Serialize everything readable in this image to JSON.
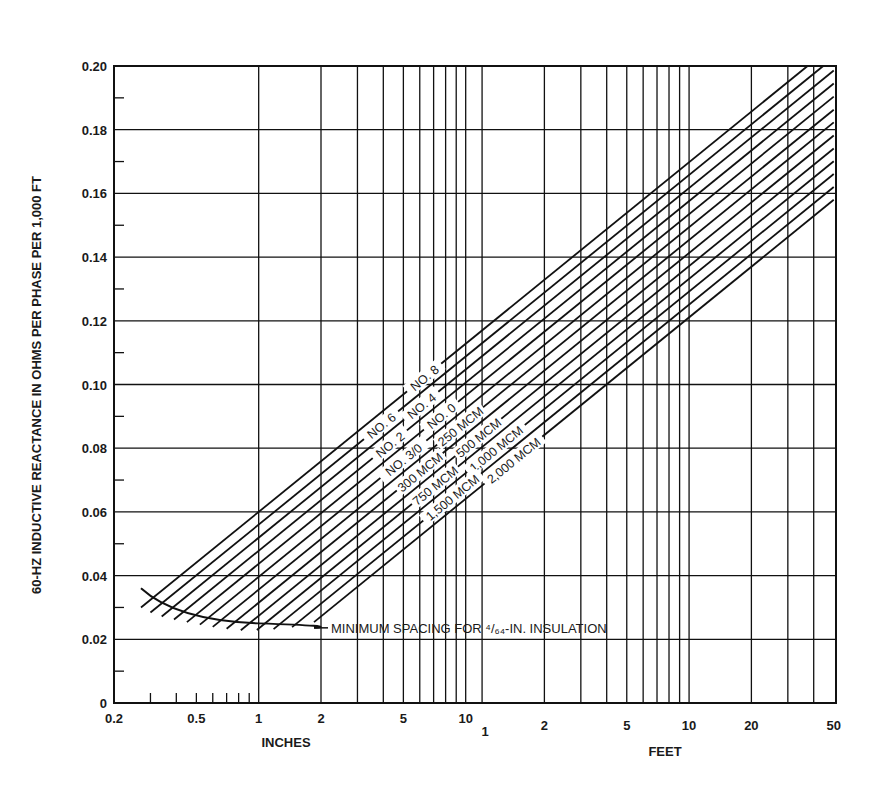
{
  "chart_data": {
    "type": "line",
    "title": "",
    "ylabel": "60-HZ INDUCTIVE REACTANCE IN OHMS PER PHASE PER 1,000 FT",
    "xlabel_inches": "INCHES",
    "xlabel_feet": "FEET",
    "x_scale": "log",
    "xlim_inches": [
      0.2,
      600
    ],
    "ylim": [
      0,
      0.2
    ],
    "grid": true,
    "y_ticks": [
      "0",
      "0.02",
      "0.04",
      "0.06",
      "0.08",
      "0.10",
      "0.12",
      "0.14",
      "0.16",
      "0.18",
      "0.20"
    ],
    "x_tick_labels_inches": [
      {
        "label": "0.2",
        "value_in": 0.2
      },
      {
        "label": "0.5",
        "value_in": 0.5
      },
      {
        "label": "1",
        "value_in": 1
      },
      {
        "label": "2",
        "value_in": 2
      },
      {
        "label": "5",
        "value_in": 5
      },
      {
        "label": "10",
        "value_in": 10
      }
    ],
    "x_tick_labels_feet": [
      {
        "label": "1",
        "value_in": 12
      },
      {
        "label": "2",
        "value_in": 24
      },
      {
        "label": "5",
        "value_in": 60
      },
      {
        "label": "10",
        "value_in": 120
      },
      {
        "label": "20",
        "value_in": 240
      },
      {
        "label": "50",
        "value_in": 600
      }
    ],
    "slope_per_decade": 0.0528,
    "series": [
      {
        "name": "NO. 8",
        "value_at_1in": 0.06,
        "start_in": 0.27
      },
      {
        "name": "NO. 6",
        "value_at_1in": 0.056,
        "start_in": 0.3
      },
      {
        "name": "NO. 4",
        "value_at_1in": 0.0519,
        "start_in": 0.34
      },
      {
        "name": "NO. 2",
        "value_at_1in": 0.0478,
        "start_in": 0.39
      },
      {
        "name": "NO. 0",
        "value_at_1in": 0.0437,
        "start_in": 0.45
      },
      {
        "name": "NO. 3/0",
        "value_at_1in": 0.0396,
        "start_in": 0.52
      },
      {
        "name": "250 MCM",
        "value_at_1in": 0.0356,
        "start_in": 0.6
      },
      {
        "name": "300 MCM",
        "value_at_1in": 0.0315,
        "start_in": 0.7
      },
      {
        "name": "500 MCM",
        "value_at_1in": 0.0274,
        "start_in": 0.82
      },
      {
        "name": "750 MCM",
        "value_at_1in": 0.0234,
        "start_in": 0.98
      },
      {
        "name": "1,000 MCM",
        "value_at_1in": 0.0194,
        "start_in": 1.18
      },
      {
        "name": "1,500 MCM",
        "value_at_1in": 0.0153,
        "start_in": 1.45
      },
      {
        "name": "2,000 MCM",
        "value_at_1in": 0.0113,
        "start_in": 1.85
      }
    ],
    "annotations": [
      {
        "text": "MINIMUM SPACING FOR ⁴/₆₄-IN. INSULATION",
        "points": [
          [
            0.27,
            0.036
          ],
          [
            0.5,
            0.029
          ],
          [
            1.0,
            0.025
          ],
          [
            1.85,
            0.0236
          ]
        ]
      }
    ]
  }
}
